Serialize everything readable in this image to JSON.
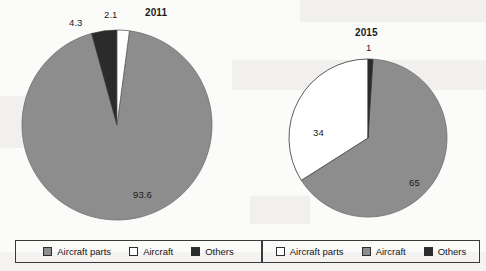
{
  "figure": {
    "background_color": "#fbfbfa",
    "series_colors": {
      "aircraft_parts_2011": "#8d8d8d",
      "aircraft_2011": "#ffffff",
      "others_2011": "#2b2b2b",
      "aircraft_parts_2015": "#ffffff",
      "aircraft_2015": "#8d8d8d",
      "others_2015": "#2b2b2b"
    }
  },
  "chart_data": [
    {
      "type": "pie",
      "title": "2011",
      "categories": [
        "Aircraft parts",
        "Aircraft",
        "Others"
      ],
      "values": [
        93.6,
        2.1,
        4.3
      ],
      "value_labels": [
        "93.6",
        "2.1",
        "4.3"
      ],
      "colors": [
        "#8d8d8d",
        "#ffffff",
        "#2b2b2b"
      ],
      "legend_position": "bottom",
      "legend": [
        {
          "label": "Aircraft parts",
          "swatch": "gray"
        },
        {
          "label": "Aircraft",
          "swatch": "white"
        },
        {
          "label": "Others",
          "swatch": "dark"
        }
      ],
      "geometry": {
        "cx": 117,
        "cy": 125,
        "r": 95,
        "start_angle_deg": -90
      }
    },
    {
      "type": "pie",
      "title": "2015",
      "categories": [
        "Aircraft parts",
        "Aircraft",
        "Others"
      ],
      "values": [
        34,
        65,
        1
      ],
      "value_labels": [
        "34",
        "65",
        "1"
      ],
      "colors": [
        "#ffffff",
        "#8d8d8d",
        "#2b2b2b"
      ],
      "legend_position": "bottom",
      "legend": [
        {
          "label": "Aircraft parts",
          "swatch": "white"
        },
        {
          "label": "Aircraft",
          "swatch": "gray"
        },
        {
          "label": "Others",
          "swatch": "dark"
        }
      ],
      "geometry": {
        "cx": 368,
        "cy": 138,
        "r": 79,
        "start_angle_deg": -90
      }
    }
  ],
  "labels_2011": {
    "year": "2011",
    "aircraft_parts": "93.6",
    "aircraft": "2.1",
    "others": "4.3"
  },
  "labels_2015": {
    "year": "2015",
    "others": "1",
    "aircraft_parts": "34",
    "aircraft": "65"
  },
  "legend_2011": {
    "item0": "Aircraft parts",
    "item1": "Aircraft",
    "item2": "Others"
  },
  "legend_2015": {
    "item0": "Aircraft parts",
    "item1": "Aircraft",
    "item2": "Others"
  }
}
